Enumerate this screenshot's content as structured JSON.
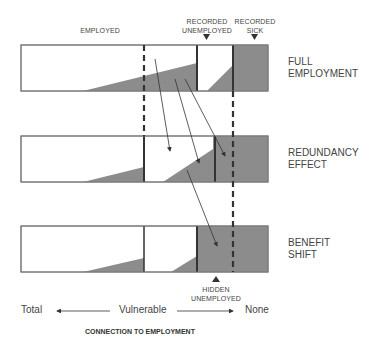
{
  "diagram": {
    "top_labels": {
      "employed": "EMPLOYED",
      "recorded_unemployed_1": "RECORDED",
      "recorded_unemployed_2": "UNEMPLOYED",
      "recorded_sick_1": "RECORDED",
      "recorded_sick_2": "SICK"
    },
    "rows": [
      {
        "label_1": "FULL",
        "label_2": "EMPLOYMENT"
      },
      {
        "label_1": "REDUNDANCY",
        "label_2": "EFFECT"
      },
      {
        "label_1": "BENEFIT",
        "label_2": "SHIFT"
      }
    ],
    "bottom_label": {
      "hidden_1": "HIDDEN",
      "hidden_2": "UNEMPLOYED"
    },
    "axis": {
      "left": "Total",
      "middle": "Vulnerable",
      "right": "None",
      "title": "CONNECTION TO EMPLOYMENT"
    },
    "colors": {
      "fill_gray": "#8c8c8c",
      "line": "#333333",
      "border": "#666666"
    }
  }
}
